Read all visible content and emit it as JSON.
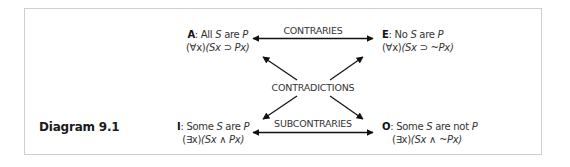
{
  "diagram": {
    "caption": "Diagram 9.1",
    "propositions": {
      "A": {
        "letter": "A",
        "sep": ": ",
        "statement_pre": "All ",
        "subject": "S",
        "statement_mid": " are ",
        "predicate": "P",
        "formula_quant": "(∀x)",
        "formula_body": "(Sx ⊃ Px)"
      },
      "E": {
        "letter": "E",
        "sep": ": ",
        "statement_pre": "No ",
        "subject": "S",
        "statement_mid": " are ",
        "predicate": "P",
        "formula_quant": "(∀x)",
        "formula_body": "(Sx ⊃ ~Px)"
      },
      "I": {
        "letter": "I",
        "sep": ": ",
        "statement_pre": "Some ",
        "subject": "S",
        "statement_mid": " are ",
        "predicate": "P",
        "formula_quant": "(∃x)",
        "formula_body": "(Sx ∧ Px)"
      },
      "O": {
        "letter": "O",
        "sep": ": ",
        "statement_pre": "Some ",
        "subject": "S",
        "statement_mid": " are not ",
        "predicate": "P",
        "formula_quant": "(∃x)",
        "formula_body": "(Sx ∧ ~Px)"
      }
    },
    "relations": {
      "contraries": "CONTRARIES",
      "contradictions": "CONTRADICTIONS",
      "subcontraries": "SUBCONTRARIES"
    },
    "colors": {
      "frame": "#cfcfcf",
      "arrow": "#111111",
      "text": "#333333"
    }
  }
}
